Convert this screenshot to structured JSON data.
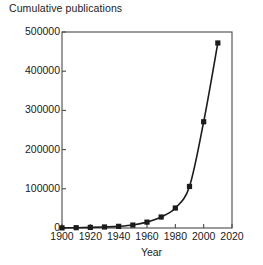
{
  "figure": {
    "title": "Cumulative publications",
    "background_color": "#ffffff",
    "foreground_color": "#1b1b1b"
  },
  "chart_data": {
    "type": "line",
    "title": "Cumulative publications",
    "xlabel": "Year",
    "ylabel": "",
    "x": [
      1900,
      1910,
      1920,
      1930,
      1940,
      1950,
      1960,
      1970,
      1980,
      1990,
      2000,
      2010
    ],
    "values": [
      300,
      800,
      1500,
      2600,
      4200,
      7500,
      15000,
      28000,
      51000,
      106000,
      271000,
      472000
    ],
    "series": [
      {
        "name": "Cumulative publications",
        "marker": "square",
        "marker_color": "#1b1b1b",
        "line_color": "#1b1b1b",
        "values": [
          300,
          800,
          1500,
          2600,
          4200,
          7500,
          15000,
          28000,
          51000,
          106000,
          271000,
          472000
        ]
      }
    ],
    "xlim": [
      1900,
      2020
    ],
    "ylim": [
      0,
      500000
    ],
    "xticks": [
      1900,
      1920,
      1940,
      1960,
      1980,
      2000,
      2020
    ],
    "xtick_labels": [
      "1900",
      "1920",
      "1940",
      "1960",
      "1980",
      "2000",
      "2020"
    ],
    "yticks": [
      0,
      100000,
      200000,
      300000,
      400000,
      500000
    ],
    "ytick_labels": [
      "0",
      "100000",
      "200000",
      "300000",
      "400000",
      "500000"
    ],
    "grid": false,
    "legend": null,
    "frame": "box"
  }
}
